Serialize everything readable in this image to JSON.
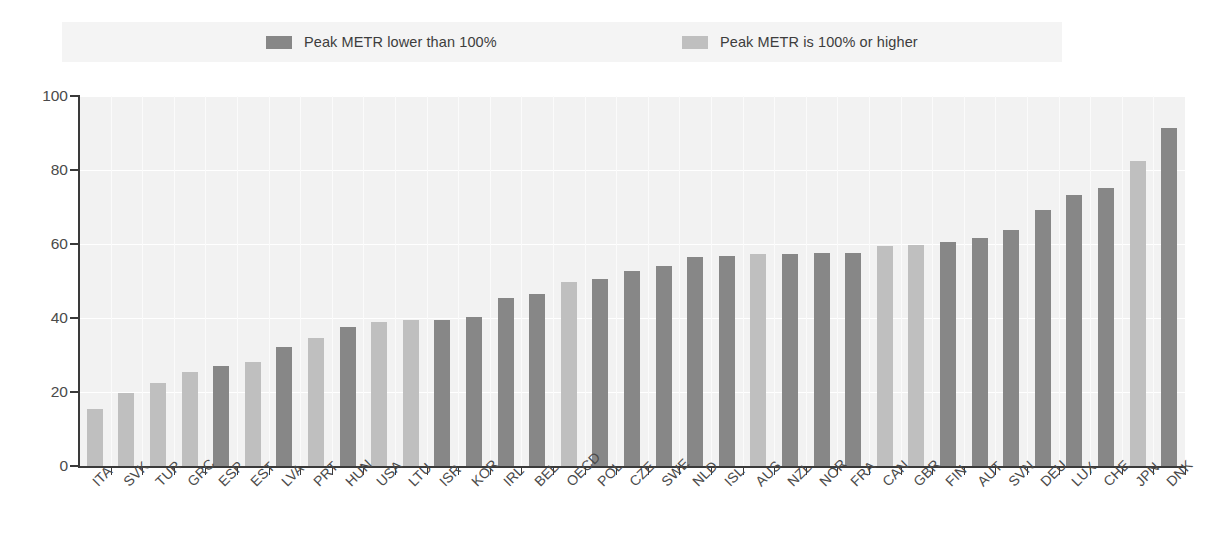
{
  "legend": {
    "entries": [
      {
        "label": "Peak METR lower than 100%",
        "color": "#878787",
        "key": "lower"
      },
      {
        "label": "Peak METR is 100% or higher",
        "color": "#bfbfbf",
        "key": "higher"
      }
    ]
  },
  "axes": {
    "y_ticks": [
      "0",
      "20",
      "40",
      "60",
      "80",
      "100"
    ],
    "y_min": 0,
    "y_max": 100
  },
  "colors": {
    "dark_bar": "#878787",
    "light_bar": "#bfbfbf",
    "plot_background": "#f2f2f2",
    "legend_background": "#f4f4f4",
    "axis": "#3a3a3a",
    "gridline": "#ffffff",
    "text": "#4a4a4a"
  },
  "chart_data": {
    "type": "bar",
    "title": "",
    "xlabel": "",
    "ylabel": "",
    "ylim": [
      0,
      100
    ],
    "yticks": [
      0,
      20,
      40,
      60,
      80,
      100
    ],
    "grid": true,
    "legend_position": "top",
    "legend": [
      "Peak METR lower than 100%",
      "Peak METR is 100% or higher"
    ],
    "categories": [
      "ITA",
      "SVK",
      "TUR",
      "GRC",
      "ESP",
      "EST",
      "LVA",
      "PRT",
      "HUN",
      "USA",
      "LTU",
      "ISR",
      "KOR",
      "IRL",
      "BEL",
      "OECD",
      "POL",
      "CZE",
      "SWE",
      "NLD",
      "ISL",
      "AUS",
      "NZL",
      "NOR",
      "FRA",
      "CAN",
      "GBR",
      "FIN",
      "AUT",
      "SVN",
      "DEU",
      "LUX",
      "CHE",
      "JPN",
      "DNK"
    ],
    "values": [
      15.5,
      19.8,
      22.3,
      25.5,
      26.9,
      28.1,
      32.1,
      34.7,
      37.6,
      38.8,
      39.4,
      39.4,
      40.2,
      45.3,
      46.4,
      49.6,
      50.6,
      52.6,
      54.1,
      56.4,
      56.8,
      57.2,
      57.4,
      57.5,
      57.6,
      59.4,
      59.6,
      60.6,
      61.5,
      63.9,
      69.2,
      73.2,
      75.1,
      82.4,
      91.3
    ],
    "group": [
      "higher",
      "higher",
      "higher",
      "higher",
      "lower",
      "higher",
      "lower",
      "higher",
      "lower",
      "higher",
      "higher",
      "lower",
      "lower",
      "lower",
      "lower",
      "higher",
      "lower",
      "lower",
      "lower",
      "lower",
      "lower",
      "higher",
      "lower",
      "lower",
      "lower",
      "higher",
      "higher",
      "lower",
      "lower",
      "lower",
      "lower",
      "lower",
      "lower",
      "higher",
      "lower"
    ]
  }
}
